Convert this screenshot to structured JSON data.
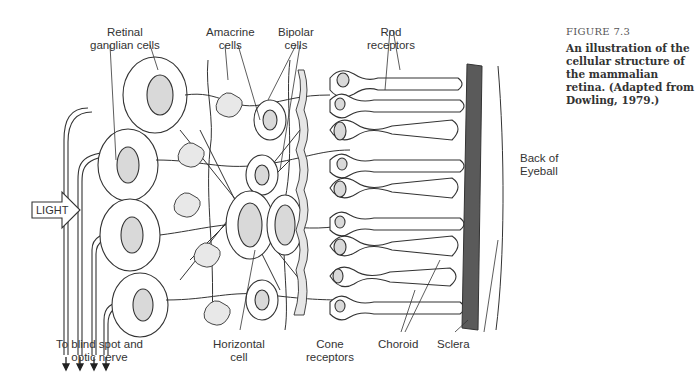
{
  "figure": {
    "number": "FIGURE 7.3",
    "caption": "An illustration of the cellular structure of the mammalian retina. (Adapted from Dowling, 1979.)"
  },
  "labels": {
    "retinal_ganglian": [
      "Retinal",
      "ganglian cells"
    ],
    "amacrine": [
      "Amacrine",
      "cells"
    ],
    "bipolar": [
      "Bipolar",
      "cells"
    ],
    "rod": [
      "Rod",
      "receptors"
    ],
    "light": "LIGHT",
    "back_of_eyeball": [
      "Back of",
      "Eyeball"
    ],
    "blind_spot": [
      "To blind spot and",
      "optic nerve"
    ],
    "horizontal": [
      "Horizontal",
      "cell"
    ],
    "cone": [
      "Cone",
      "receptors"
    ],
    "choroid": "Choroid",
    "sclera": "Sclera"
  },
  "colors": {
    "nucleus": "#d9d9d9",
    "choroid": "#5a5a5a",
    "line": "#333333"
  }
}
